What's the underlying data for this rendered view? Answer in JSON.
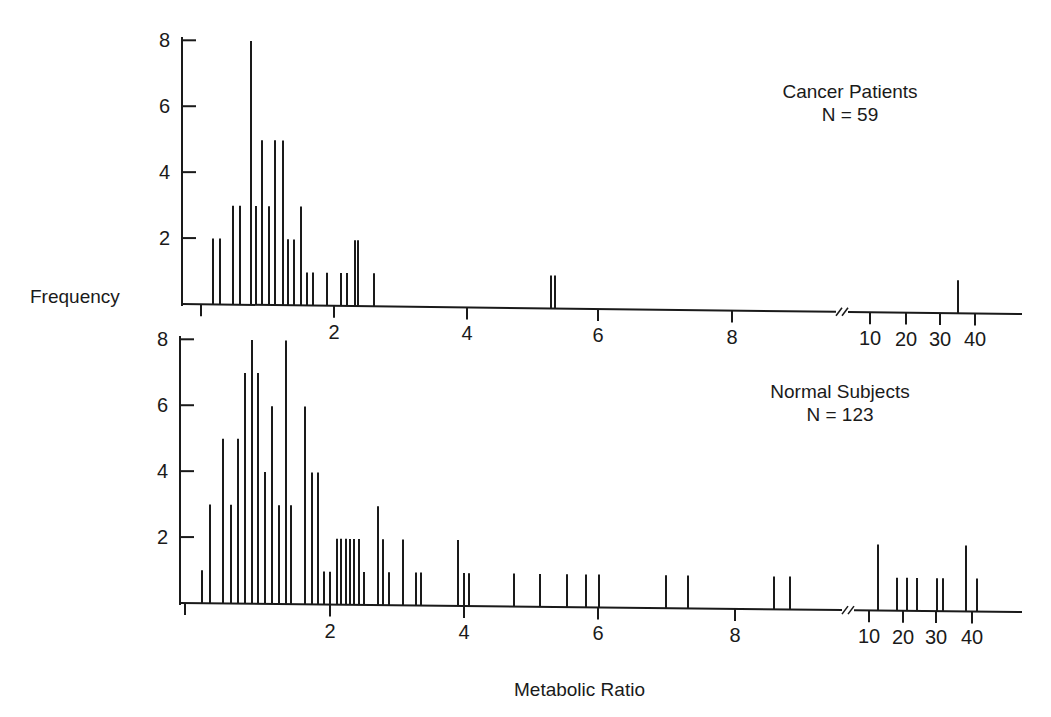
{
  "figure": {
    "ylabel": "Frequency",
    "xlabel": "Metabolic Ratio",
    "break_marker": "//"
  },
  "panels": [
    {
      "id": "cancer",
      "title": "Cancer Patients",
      "n_label": "N = 59",
      "axis": {
        "y_axis_x": 182,
        "y_top": 37,
        "baseline_y": 304,
        "baseline_y_right": 314,
        "x_end": 1022,
        "px_per_unit": 33.5,
        "x_ticks": [
          {
            "label": "",
            "x": 201
          },
          {
            "label": "2",
            "x": 334
          },
          {
            "label": "4",
            "x": 467
          },
          {
            "label": "6",
            "x": 598
          },
          {
            "label": "8",
            "x": 732
          },
          {
            "label": "10",
            "x": 870
          },
          {
            "label": "20",
            "x": 906
          },
          {
            "label": "30",
            "x": 940
          },
          {
            "label": "40",
            "x": 975
          }
        ],
        "y_ticks": [
          {
            "label": "8",
            "value": 8
          },
          {
            "label": "6",
            "value": 6
          },
          {
            "label": "4",
            "value": 4
          },
          {
            "label": "2",
            "value": 2
          }
        ],
        "break_x": 840
      },
      "bars_px": [
        [
          213,
          2
        ],
        [
          220,
          2
        ],
        [
          233,
          3
        ],
        [
          240,
          3
        ],
        [
          251,
          8
        ],
        [
          256,
          3
        ],
        [
          262,
          5
        ],
        [
          269,
          3
        ],
        [
          275,
          5
        ],
        [
          283,
          5
        ],
        [
          288,
          2
        ],
        [
          294,
          2
        ],
        [
          301,
          3
        ],
        [
          307,
          1
        ],
        [
          313,
          1
        ],
        [
          327,
          1
        ],
        [
          341,
          1
        ],
        [
          347,
          1
        ],
        [
          355,
          2
        ],
        [
          358,
          2
        ],
        [
          374,
          1
        ],
        [
          551,
          1
        ],
        [
          555,
          1
        ],
        [
          958,
          1
        ]
      ]
    },
    {
      "id": "normal",
      "title": "Normal Subjects",
      "n_label": "N = 123",
      "axis": {
        "y_axis_x": 180,
        "y_top": 336,
        "baseline_y": 603,
        "baseline_y_right": 612,
        "x_end": 1022,
        "px_per_unit": 33.5,
        "x_ticks": [
          {
            "label": "",
            "x": 185
          },
          {
            "label": "2",
            "x": 330
          },
          {
            "label": "4",
            "x": 464
          },
          {
            "label": "6",
            "x": 598
          },
          {
            "label": "8",
            "x": 735
          },
          {
            "label": "10",
            "x": 869
          },
          {
            "label": "20",
            "x": 903
          },
          {
            "label": "30",
            "x": 936
          },
          {
            "label": "40",
            "x": 972
          }
        ],
        "y_ticks": [
          {
            "label": "8",
            "value": 8
          },
          {
            "label": "6",
            "value": 6
          },
          {
            "label": "4",
            "value": 4
          },
          {
            "label": "2",
            "value": 2
          }
        ],
        "break_x": 846
      },
      "bars_px": [
        [
          202,
          1
        ],
        [
          210,
          3
        ],
        [
          223,
          5
        ],
        [
          231,
          3
        ],
        [
          238,
          5
        ],
        [
          245,
          7
        ],
        [
          252,
          8
        ],
        [
          258,
          7
        ],
        [
          265,
          4
        ],
        [
          272,
          6
        ],
        [
          279,
          3
        ],
        [
          286,
          8
        ],
        [
          291,
          3
        ],
        [
          305,
          6
        ],
        [
          312,
          4
        ],
        [
          318,
          4
        ],
        [
          324,
          1
        ],
        [
          330,
          1
        ],
        [
          337,
          2
        ],
        [
          341,
          2
        ],
        [
          346,
          2
        ],
        [
          350,
          2
        ],
        [
          354,
          2
        ],
        [
          359,
          2
        ],
        [
          364,
          1
        ],
        [
          378,
          3
        ],
        [
          383,
          2
        ],
        [
          389,
          1
        ],
        [
          403,
          2
        ],
        [
          416,
          1
        ],
        [
          421,
          1
        ],
        [
          458,
          2
        ],
        [
          464,
          1
        ],
        [
          469,
          1
        ],
        [
          514,
          1
        ],
        [
          540,
          1
        ],
        [
          567,
          1
        ],
        [
          586,
          1
        ],
        [
          599,
          1
        ],
        [
          666,
          1
        ],
        [
          688,
          1
        ],
        [
          774,
          1
        ],
        [
          790,
          1
        ],
        [
          878,
          2
        ],
        [
          897,
          1
        ],
        [
          907,
          1
        ],
        [
          917,
          1
        ],
        [
          937,
          1
        ],
        [
          943,
          1
        ],
        [
          966,
          2
        ],
        [
          977,
          1
        ]
      ]
    }
  ],
  "chart_data": [
    {
      "type": "bar",
      "title": "Cancer Patients (N = 59)",
      "xlabel": "Metabolic Ratio",
      "ylabel": "Frequency",
      "ylim": [
        0,
        8
      ],
      "x_axis": "linear 0–9 then broken axis with 10, 20, 30, 40",
      "grid": false,
      "x": [
        0.35,
        0.55,
        0.95,
        1.15,
        1.5,
        1.65,
        1.8,
        2.0,
        2.2,
        2.45,
        2.6,
        2.8,
        3.0,
        3.2,
        3.35,
        3.8,
        4.2,
        4.4,
        4.6,
        4.7,
        5.2,
        5.25,
        5.35,
        28
      ],
      "values": [
        2,
        2,
        3,
        3,
        8,
        3,
        5,
        3,
        5,
        5,
        2,
        2,
        3,
        1,
        1,
        1,
        1,
        1,
        2,
        2,
        1,
        1,
        1,
        1
      ],
      "note": "x values are approximate metabolic ratios read off the axis; the first cluster spans roughly 0.3–2.6 on the axis scale"
    },
    {
      "type": "bar",
      "title": "Normal Subjects (N = 123)",
      "xlabel": "Metabolic Ratio",
      "ylabel": "Frequency",
      "ylim": [
        0,
        8
      ],
      "x_axis": "linear 0–9 then broken axis with 10, 20, 30, 40",
      "grid": false,
      "x": [
        0.25,
        0.35,
        0.55,
        0.7,
        0.8,
        0.9,
        1.0,
        1.1,
        1.2,
        1.3,
        1.4,
        1.5,
        1.6,
        1.8,
        1.9,
        2.0,
        2.1,
        2.2,
        2.3,
        2.35,
        2.4,
        2.45,
        2.5,
        2.55,
        2.65,
        2.85,
        2.95,
        3.05,
        3.25,
        3.45,
        3.5,
        4.0,
        4.05,
        4.1,
        4.8,
        5.2,
        5.55,
        5.85,
        6.0,
        7.0,
        7.3,
        8.6,
        8.85,
        13,
        18,
        21,
        24,
        30,
        31,
        38,
        41
      ],
      "values": [
        1,
        3,
        5,
        3,
        5,
        7,
        8,
        7,
        4,
        6,
        3,
        8,
        3,
        6,
        4,
        4,
        1,
        1,
        2,
        2,
        2,
        2,
        2,
        2,
        1,
        3,
        2,
        1,
        2,
        1,
        1,
        2,
        1,
        1,
        1,
        1,
        1,
        1,
        1,
        1,
        1,
        1,
        1,
        2,
        1,
        1,
        1,
        1,
        1,
        2,
        1
      ]
    }
  ]
}
